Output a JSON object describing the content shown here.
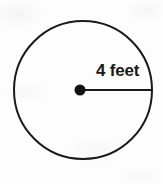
{
  "figure": {
    "kind": "circle-radius-diagram",
    "shape_name": "circle",
    "title": "",
    "background_color": "#fdfdfd",
    "stroke_color": "#1a1a1a"
  },
  "circle": {
    "center_x": 83,
    "center_y": 90,
    "radius_px": 69,
    "stroke_width": 2,
    "fill": "none"
  },
  "center_point": {
    "label": "",
    "x": 80,
    "y": 90,
    "dot_radius_px": 5.5,
    "color": "#111111"
  },
  "radius_segment": {
    "label": "4 feet",
    "value": 4,
    "unit": "feet",
    "from_x": 80,
    "from_y": 90,
    "to_x": 152,
    "to_y": 90,
    "stroke_width": 2,
    "color": "#1a1a1a"
  },
  "label": {
    "text": "4 feet",
    "font_size_px": 17,
    "weight": "bold",
    "color": "#1a1a1a",
    "x": 96,
    "y": 62
  }
}
